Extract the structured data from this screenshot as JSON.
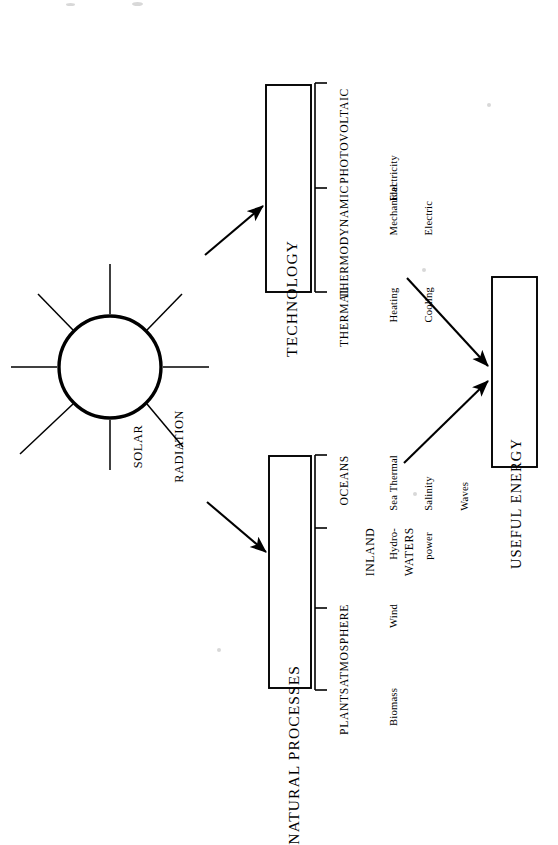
{
  "figure": {
    "orientation": "rotated-90-ccw",
    "background_color": "#ffffff",
    "ink_color": "#000000"
  },
  "source": {
    "label": "SOLAR\nRADIATION",
    "line1": "SOLAR",
    "line2": "RADIATION",
    "shape": "sun-circle-with-rays",
    "ray_count": 8
  },
  "branches": [
    {
      "id": "technology",
      "title": "TECHNOLOGY",
      "categories": [
        {
          "name": "THERMAL",
          "outputs": [
            "Heating",
            "Cooling"
          ]
        },
        {
          "name": "THERMODYNAMIC",
          "outputs": [
            "Mechanical",
            "Electric"
          ]
        },
        {
          "name": "PHOTOVOLTAIC",
          "outputs": [
            "Electricity"
          ]
        }
      ]
    },
    {
      "id": "natural-processes",
      "title": "NATURAL PROCESSES",
      "categories": [
        {
          "name": "PLANTS",
          "outputs": [
            "Biomass"
          ]
        },
        {
          "name": "ATMOSPHERE",
          "outputs": [
            "Wind"
          ]
        },
        {
          "name": "INLAND\nWATERS",
          "name_line1": "INLAND",
          "name_line2": "WATERS",
          "outputs": [
            "Hydro-",
            "power"
          ]
        },
        {
          "name": "OCEANS",
          "outputs": [
            "Sea Thermal",
            "Salinity",
            "Waves"
          ]
        }
      ]
    }
  ],
  "sink": {
    "id": "useful-energy",
    "title": "USEFUL ENERGY"
  },
  "arrows": [
    {
      "from": "solar-radiation",
      "to": "technology"
    },
    {
      "from": "solar-radiation",
      "to": "natural-processes"
    },
    {
      "from": "technology",
      "to": "useful-energy"
    },
    {
      "from": "natural-processes",
      "to": "useful-energy"
    }
  ],
  "technology_labels": {
    "title": "TECHNOLOGY",
    "cat0": "THERMAL",
    "cat1": "THERMODYNAMIC",
    "cat2": "PHOTOVOLTAIC",
    "out0_l1": "Heating",
    "out0_l2": "Cooling",
    "out1_l1": "Mechanical",
    "out1_l2": "Electric",
    "out2_l1": "Electricity"
  },
  "natural_labels": {
    "title": "NATURAL PROCESSES",
    "cat0": "PLANTS",
    "cat1": "ATMOSPHERE",
    "cat2_l1": "INLAND",
    "cat2_l2": "WATERS",
    "cat3": "OCEANS",
    "out0_l1": "Biomass",
    "out1_l1": "Wind",
    "out2_l1": "Hydro-",
    "out2_l2": "power",
    "out3_l1": "Sea Thermal",
    "out3_l2": "Salinity",
    "out3_l3": "Waves"
  }
}
